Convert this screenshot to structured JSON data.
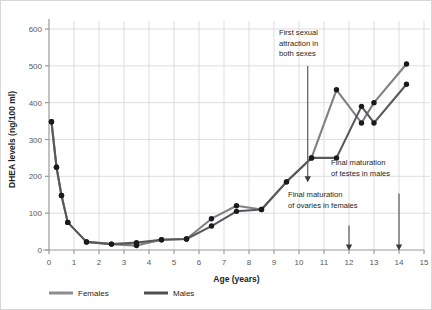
{
  "chart_data": {
    "type": "line",
    "title": "",
    "xlabel": "Age (years)",
    "ylabel": "DHEA levels (ng/100 ml)",
    "xlim": [
      0,
      15
    ],
    "ylim": [
      0,
      600
    ],
    "xticks": [
      0,
      1,
      2,
      3,
      4,
      5,
      6,
      7,
      8,
      9,
      10,
      11,
      12,
      13,
      14,
      15
    ],
    "yticks": [
      0,
      100,
      200,
      300,
      400,
      500,
      600
    ],
    "grid": true,
    "legend_position": "bottom",
    "series": [
      {
        "name": "Females",
        "color": "#808184",
        "x": [
          0.1,
          0.3,
          0.5,
          0.75,
          1.5,
          2.5,
          3.5,
          4.5,
          5.5,
          6.5,
          7.5,
          8.5,
          9.5,
          10.5,
          11.5,
          12.5,
          13.0,
          14.3
        ],
        "values": [
          348,
          225,
          148,
          75,
          22,
          16,
          12,
          28,
          30,
          85,
          120,
          110,
          185,
          250,
          435,
          345,
          400,
          505
        ]
      },
      {
        "name": "Males",
        "color": "#58595b",
        "x": [
          0.1,
          0.3,
          0.5,
          0.75,
          1.5,
          2.5,
          3.5,
          4.5,
          5.5,
          6.5,
          7.5,
          8.5,
          9.5,
          10.5,
          11.5,
          12.5,
          13.0,
          14.3
        ],
        "values": [
          348,
          225,
          148,
          75,
          22,
          16,
          20,
          28,
          30,
          65,
          105,
          110,
          185,
          250,
          250,
          390,
          345,
          450
        ]
      }
    ],
    "annotations": [
      {
        "id": "first-sexual-attraction",
        "lines": [
          "First sexual",
          "attraction in",
          "both sexes"
        ],
        "arrow_x": 10.35,
        "arrow_to_y": 185
      },
      {
        "id": "final-maturation-ovaries",
        "lines": [
          "Final maturation",
          "of ovaries in females"
        ],
        "arrow_x": 12.0,
        "arrow_to_y": 0
      },
      {
        "id": "final-maturation-testes",
        "lines": [
          "Final maturation",
          "of testes in males"
        ],
        "arrow_x": 14.0,
        "arrow_to_y": 0
      }
    ]
  },
  "legend": {
    "items": [
      {
        "label": "Females",
        "color": "#8a8c8e"
      },
      {
        "label": "Males",
        "color": "#4d4e50"
      }
    ]
  },
  "colors": {
    "grid": "#d9d9e0",
    "axis": "#9a9a9a",
    "text": "#231f20",
    "tick_text": "#58595b",
    "females": "#808184",
    "males": "#58595b",
    "marker": "#1a1a1a",
    "border": "#d8d8d8"
  }
}
